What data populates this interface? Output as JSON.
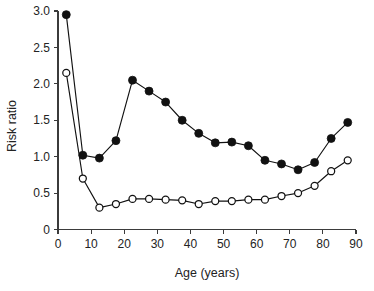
{
  "chart_data": {
    "type": "line",
    "title": "",
    "xlabel": "Age (years)",
    "ylabel": "Risk ratio",
    "xlim": [
      0,
      90
    ],
    "ylim": [
      0,
      3.0
    ],
    "grid": false,
    "legend_position": "none",
    "xticks": [
      0,
      10,
      20,
      30,
      40,
      50,
      60,
      70,
      80,
      90
    ],
    "xtick_labels": [
      "0",
      "10",
      "20",
      "30",
      "40",
      "50",
      "60",
      "70",
      "80",
      "90"
    ],
    "yticks": [
      0,
      0.5,
      1.0,
      1.5,
      2.0,
      2.5,
      3.0
    ],
    "ytick_labels": [
      "0",
      "0.5",
      "1.0",
      "1.5",
      "2.0",
      "2.5",
      "3.0"
    ],
    "x": [
      2.5,
      7.5,
      12.5,
      17.5,
      22.5,
      27.5,
      32.5,
      37.5,
      42.5,
      47.5,
      52.5,
      57.5,
      62.5,
      67.5,
      72.5,
      77.5,
      82.5,
      87.5
    ],
    "series": [
      {
        "name": "filled-circle-series",
        "marker": "filled-circle",
        "color": "#111111",
        "values": [
          2.95,
          1.02,
          0.98,
          1.22,
          2.05,
          1.9,
          1.75,
          1.5,
          1.32,
          1.19,
          1.2,
          1.15,
          0.95,
          0.9,
          0.82,
          0.92,
          1.25,
          1.47
        ]
      },
      {
        "name": "open-circle-series",
        "marker": "open-circle",
        "color": "#111111",
        "values": [
          2.15,
          0.7,
          0.3,
          0.35,
          0.42,
          0.42,
          0.41,
          0.4,
          0.35,
          0.39,
          0.39,
          0.41,
          0.41,
          0.46,
          0.5,
          0.6,
          0.8,
          0.95
        ]
      }
    ]
  }
}
